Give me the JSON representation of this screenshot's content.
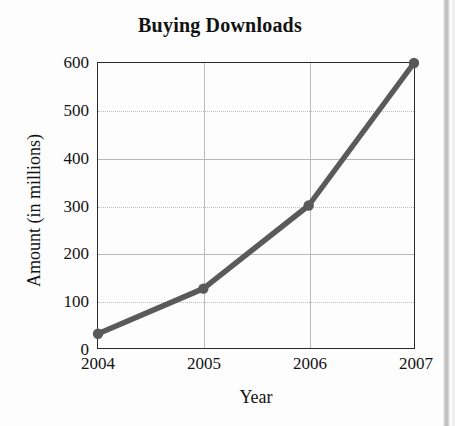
{
  "chart_data": {
    "type": "line",
    "title": "Buying Downloads",
    "xlabel": "Year",
    "ylabel": "Amount (in millions)",
    "categories": [
      "2004",
      "2005",
      "2006",
      "2007"
    ],
    "x": [
      2004,
      2005,
      2006,
      2007
    ],
    "values": [
      30,
      125,
      300,
      600
    ],
    "series": [
      {
        "name": "Downloads purchased",
        "values": [
          30,
          125,
          300,
          600
        ]
      }
    ],
    "xlim": [
      2004,
      2007
    ],
    "ylim": [
      0,
      600
    ],
    "ytick_labels": [
      "0",
      "100",
      "200",
      "300",
      "400",
      "500",
      "600"
    ],
    "ytick_values": [
      0,
      100,
      200,
      300,
      400,
      500,
      600
    ],
    "xtick_labels": [
      "2004",
      "2005",
      "2006",
      "2007"
    ],
    "grid": true,
    "grid_axis": "both",
    "legend": false,
    "legend_position": "none",
    "marker": "circle",
    "line_color": "#5a5a5a",
    "marker_color": "#595959",
    "grid_color": "#bcbcbc",
    "axis_color": "#2b2b2b",
    "background_color": "#fdfdfd",
    "text_color": "#131313"
  }
}
